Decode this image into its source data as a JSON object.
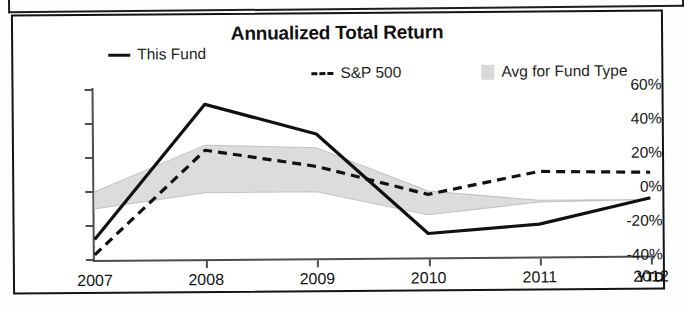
{
  "chart_data": {
    "type": "line",
    "title": "Annualized Total Return",
    "xlabel": "",
    "ylabel": "",
    "grid": false,
    "legend_position": "top",
    "categories": [
      "2007",
      "2008",
      "2009",
      "2010",
      "2011",
      "2012"
    ],
    "x_tick_note": "YTD",
    "y_ticks": [
      "60%",
      "40%",
      "20%",
      "0%",
      "-20%",
      "-40%"
    ],
    "y_tick_values": [
      60,
      40,
      20,
      0,
      -20,
      -40
    ],
    "ylim": [
      -40,
      60
    ],
    "series": [
      {
        "name": "This Fund",
        "style": "solid",
        "color": "#111111",
        "values": [
          -28,
          51,
          33,
          -26,
          -21,
          -6
        ]
      },
      {
        "name": "S&P 500",
        "style": "dashed",
        "color": "#111111",
        "values": [
          -37,
          24,
          14,
          -3,
          10,
          9
        ]
      },
      {
        "name": "Avg for Fund Type",
        "style": "band",
        "color": "#d9d9d9",
        "upper": [
          0,
          27,
          25,
          -1,
          -7,
          -7
        ],
        "lower": [
          -10,
          -1,
          -1,
          -15,
          -8,
          -7
        ]
      }
    ]
  },
  "chart": {
    "title": "Annualized Total Return",
    "ytd_note": "YTD"
  },
  "legend": {
    "items": [
      {
        "label": "This Fund",
        "marker": "solid-line-swatch"
      },
      {
        "label": "S&P 500",
        "marker": "dashed-line-swatch"
      },
      {
        "label": "Avg for Fund Type",
        "marker": "shaded-band-swatch"
      }
    ]
  },
  "axes": {
    "y_labels": [
      "60%",
      "40%",
      "20%",
      "0%",
      "-20%",
      "-40%"
    ],
    "x_labels": [
      "2007",
      "2008",
      "2009",
      "2010",
      "2011",
      "2012"
    ]
  }
}
